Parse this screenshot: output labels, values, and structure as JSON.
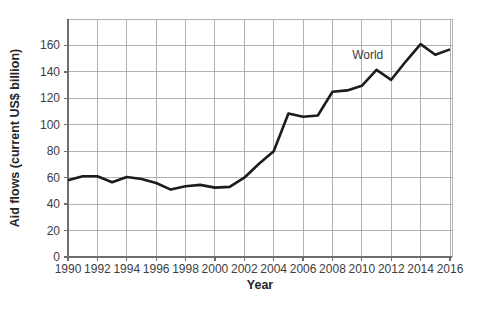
{
  "figure": {
    "background_color": "#ffffff",
    "line_color": "#1c1c1c",
    "grid_color": "#b3b3b3",
    "axis_color": "#6e6e6e",
    "text_color": "#3d3d3d"
  },
  "chart_data": {
    "type": "line",
    "title": "",
    "xlabel": "Year",
    "ylabel": "Aid flows (current US$ billion)",
    "xlim": [
      1990,
      2016
    ],
    "ylim": [
      0,
      180
    ],
    "grid": true,
    "legend_position": "none",
    "x_ticks": [
      1990,
      1992,
      1994,
      1996,
      1998,
      2000,
      2002,
      2004,
      2006,
      2008,
      2010,
      2012,
      2014,
      2016
    ],
    "y_ticks": [
      0,
      20,
      40,
      60,
      80,
      100,
      120,
      140,
      160
    ],
    "series": [
      {
        "name": "World",
        "x": [
          1990,
          1991,
          1992,
          1993,
          1994,
          1995,
          1996,
          1997,
          1998,
          1999,
          2000,
          2001,
          2002,
          2003,
          2004,
          2005,
          2006,
          2007,
          2008,
          2009,
          2010,
          2011,
          2012,
          2013,
          2014,
          2015,
          2016
        ],
        "values": [
          58,
          61,
          61,
          56.5,
          60.5,
          59,
          56,
          51,
          53.5,
          54.5,
          52.5,
          53,
          60,
          70.5,
          80,
          108.5,
          106,
          107,
          125,
          126,
          129.5,
          141.5,
          134,
          148,
          161,
          153,
          157
        ]
      }
    ],
    "annotation": {
      "text": "World",
      "x": 2010.4,
      "y": 150
    }
  }
}
